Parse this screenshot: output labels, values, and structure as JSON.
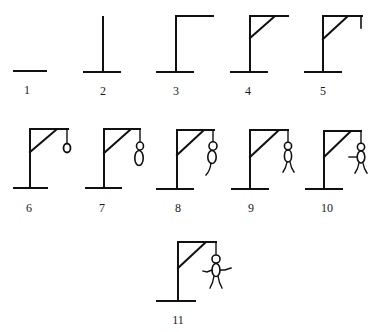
{
  "stroke_color": "#111111",
  "background": "#ffffff",
  "stages": [
    {
      "label": "1",
      "parts": [
        "base"
      ]
    },
    {
      "label": "2",
      "parts": [
        "base",
        "pole"
      ]
    },
    {
      "label": "3",
      "parts": [
        "base",
        "pole",
        "beam"
      ]
    },
    {
      "label": "4",
      "parts": [
        "base",
        "pole",
        "beam",
        "brace"
      ]
    },
    {
      "label": "5",
      "parts": [
        "base",
        "pole",
        "beam",
        "brace",
        "rope"
      ]
    },
    {
      "label": "6",
      "parts": [
        "base",
        "pole",
        "beam",
        "brace",
        "rope",
        "head"
      ]
    },
    {
      "label": "7",
      "parts": [
        "base",
        "pole",
        "beam",
        "brace",
        "rope",
        "head",
        "body"
      ]
    },
    {
      "label": "8",
      "parts": [
        "base",
        "pole",
        "beam",
        "brace",
        "rope",
        "head",
        "body",
        "leg1"
      ]
    },
    {
      "label": "9",
      "parts": [
        "base",
        "pole",
        "beam",
        "brace",
        "rope",
        "head",
        "body",
        "leg1",
        "leg2"
      ]
    },
    {
      "label": "10",
      "parts": [
        "base",
        "pole",
        "beam",
        "brace",
        "rope",
        "head",
        "body",
        "leg1",
        "leg2",
        "arm1"
      ]
    },
    {
      "label": "11",
      "parts": [
        "base",
        "pole",
        "beam",
        "brace",
        "rope",
        "head",
        "body",
        "leg1",
        "leg2",
        "arm1",
        "arm2"
      ]
    }
  ]
}
